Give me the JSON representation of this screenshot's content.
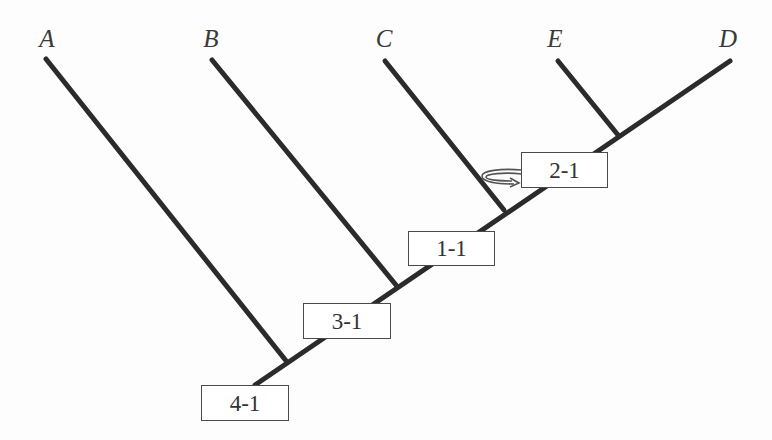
{
  "diagram": {
    "type": "phylogenetic-tree",
    "tips": [
      {
        "id": "A",
        "label": "A",
        "x": 47,
        "y": 38
      },
      {
        "id": "B",
        "label": "B",
        "x": 211,
        "y": 38
      },
      {
        "id": "C",
        "label": "C",
        "x": 384,
        "y": 38
      },
      {
        "id": "E",
        "label": "E",
        "x": 555,
        "y": 38
      },
      {
        "id": "D",
        "label": "D",
        "x": 728,
        "y": 38
      }
    ],
    "node_labels": [
      {
        "id": "n1",
        "label": "1-1",
        "x": 408,
        "y": 231,
        "w": 87,
        "h": 35
      },
      {
        "id": "n2",
        "label": "2-1",
        "x": 521,
        "y": 152,
        "w": 87,
        "h": 36
      },
      {
        "id": "n3",
        "label": "3-1",
        "x": 303,
        "y": 303,
        "w": 88,
        "h": 36
      },
      {
        "id": "n4",
        "label": "4-1",
        "x": 201,
        "y": 385,
        "w": 88,
        "h": 36
      }
    ],
    "line_color": "#2b2b2b",
    "box_border_color": "#4a4a4a",
    "annotation": "curved arrow from node 2-1 box looping to branch C"
  }
}
